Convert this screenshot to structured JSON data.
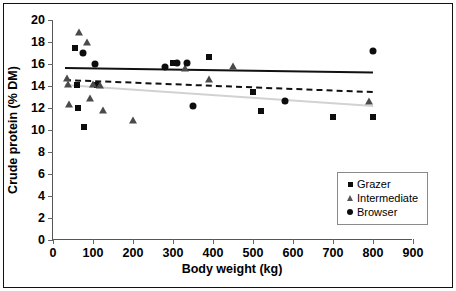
{
  "chart_data": {
    "type": "scatter",
    "title": "",
    "xlabel": "Body weight (kg)",
    "ylabel": "Crude protein (% DM)",
    "xlim": [
      0,
      900
    ],
    "ylim": [
      0,
      20
    ],
    "xticks": [
      0,
      100,
      200,
      300,
      400,
      500,
      600,
      700,
      800,
      900
    ],
    "yticks": [
      0,
      2,
      4,
      6,
      8,
      10,
      12,
      14,
      16,
      18,
      20
    ],
    "grid": false,
    "legend_position": "inside-bottom-right",
    "series": [
      {
        "name": "Grazer",
        "marker": "filled-square",
        "color": "#0d0d0d",
        "points": [
          {
            "x": 55,
            "y": 17.5
          },
          {
            "x": 60,
            "y": 14.1
          },
          {
            "x": 62,
            "y": 12.0
          },
          {
            "x": 78,
            "y": 10.3
          },
          {
            "x": 110,
            "y": 14.1
          },
          {
            "x": 300,
            "y": 16.1
          },
          {
            "x": 390,
            "y": 16.6
          },
          {
            "x": 500,
            "y": 13.5
          },
          {
            "x": 520,
            "y": 11.7
          },
          {
            "x": 700,
            "y": 11.2
          },
          {
            "x": 800,
            "y": 11.2
          }
        ]
      },
      {
        "name": "Intermediate",
        "marker": "open-triangle",
        "color": "#4a4a4a",
        "points": [
          {
            "x": 35,
            "y": 14.7
          },
          {
            "x": 38,
            "y": 14.2
          },
          {
            "x": 40,
            "y": 12.4
          },
          {
            "x": 65,
            "y": 18.9
          },
          {
            "x": 85,
            "y": 18.0
          },
          {
            "x": 92,
            "y": 12.9
          },
          {
            "x": 100,
            "y": 14.2
          },
          {
            "x": 118,
            "y": 14.1
          },
          {
            "x": 125,
            "y": 11.8
          },
          {
            "x": 200,
            "y": 10.9
          },
          {
            "x": 330,
            "y": 15.6
          },
          {
            "x": 390,
            "y": 14.6
          },
          {
            "x": 450,
            "y": 15.8
          },
          {
            "x": 790,
            "y": 12.6
          }
        ]
      },
      {
        "name": "Browser",
        "marker": "filled-circle",
        "color": "#0d0d0d",
        "points": [
          {
            "x": 75,
            "y": 17.0
          },
          {
            "x": 105,
            "y": 16.0
          },
          {
            "x": 280,
            "y": 15.7
          },
          {
            "x": 310,
            "y": 16.1
          },
          {
            "x": 335,
            "y": 16.1
          },
          {
            "x": 350,
            "y": 12.2
          },
          {
            "x": 580,
            "y": 12.6
          },
          {
            "x": 800,
            "y": 17.2
          }
        ]
      }
    ],
    "trendlines": [
      {
        "name": "Browser trend",
        "style": "solid",
        "color": "#111111",
        "x0": 30,
        "y0": 15.7,
        "x1": 800,
        "y1": 15.3
      },
      {
        "name": "Intermediate trend",
        "style": "dotted",
        "color": "#111111",
        "x0": 30,
        "y0": 14.6,
        "x1": 800,
        "y1": 13.5
      },
      {
        "name": "Grazer trend",
        "style": "solid-grey",
        "color": "#d2d2d2",
        "x0": 30,
        "y0": 14.2,
        "x1": 800,
        "y1": 12.3
      }
    ]
  },
  "legend": {
    "items": [
      {
        "label": "Grazer",
        "symbol": "filled-square"
      },
      {
        "label": "Intermediate",
        "symbol": "open-triangle"
      },
      {
        "label": "Browser",
        "symbol": "filled-circle"
      }
    ]
  }
}
